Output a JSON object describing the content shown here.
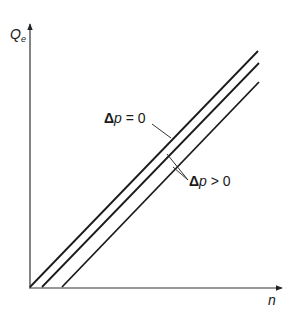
{
  "axes": {
    "y_label_main": "Q",
    "y_label_sub": "e",
    "x_label": "n"
  },
  "annotations": {
    "delta_p_zero": {
      "symbol": "Δ",
      "var": "p",
      "rel": " = 0"
    },
    "delta_p_positive": {
      "symbol": "Δ",
      "var": "p",
      "rel": " > 0"
    }
  },
  "lines": [
    {
      "name": "Δp = 0",
      "x1": 30,
      "y1": 287,
      "x2": 258,
      "y2": 51
    },
    {
      "name": "Δp > 0 (1)",
      "x1": 42,
      "y1": 287,
      "x2": 259,
      "y2": 63
    },
    {
      "name": "Δp > 0 (2)",
      "x1": 62,
      "y1": 287,
      "x2": 259,
      "y2": 82
    }
  ],
  "colors": {
    "ink": "#1a1a1a",
    "axis": "#333333"
  }
}
